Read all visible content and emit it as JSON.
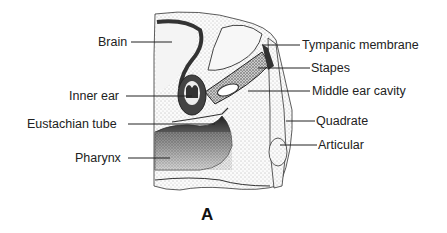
{
  "figure": {
    "panel_label": "A",
    "labels_left": [
      {
        "id": "brain",
        "text": "Brain"
      },
      {
        "id": "inner-ear",
        "text": "Inner ear"
      },
      {
        "id": "eustachian-tube",
        "text": "Eustachian tube"
      },
      {
        "id": "pharynx",
        "text": "Pharynx"
      }
    ],
    "labels_right": [
      {
        "id": "tympanic-membrane",
        "text": "Tympanic membrane"
      },
      {
        "id": "stapes",
        "text": "Stapes"
      },
      {
        "id": "middle-ear-cavity",
        "text": "Middle ear cavity"
      },
      {
        "id": "quadrate",
        "text": "Quadrate"
      },
      {
        "id": "articular",
        "text": "Articular"
      }
    ]
  }
}
